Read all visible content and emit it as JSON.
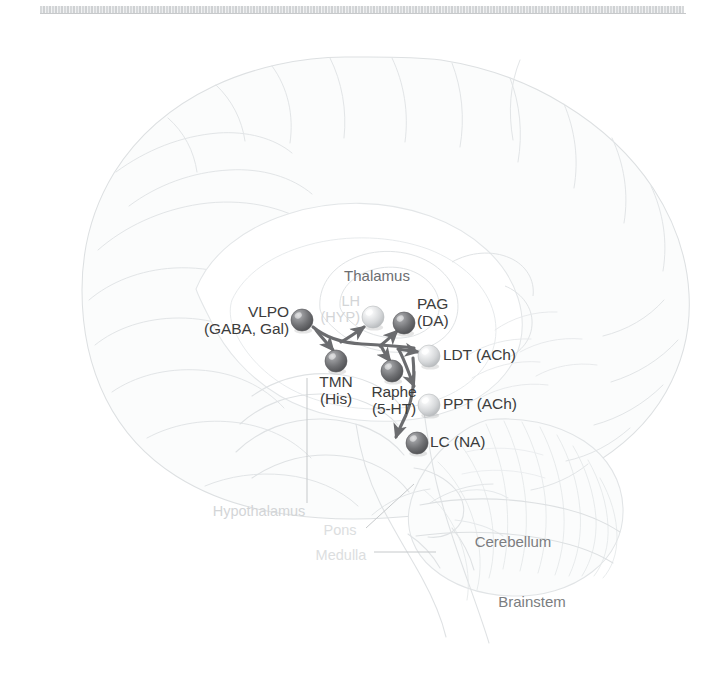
{
  "figure": {
    "background_color": "#ffffff",
    "scan_artifact": true
  },
  "anatomy_labels": [
    {
      "id": "thalamus",
      "text": "Thalamus",
      "x": 377,
      "y": 277,
      "style": "region-strong",
      "align": "center"
    },
    {
      "id": "hypothalamus",
      "text": "Hypothalamus",
      "x": 259,
      "y": 513,
      "style": "faint",
      "align": "center"
    },
    {
      "id": "pons",
      "text": "Pons",
      "x": 340,
      "y": 532,
      "style": "faint2",
      "align": "center"
    },
    {
      "id": "medulla",
      "text": "Medulla",
      "x": 341,
      "y": 557,
      "style": "faint2",
      "align": "center"
    },
    {
      "id": "cerebellum",
      "text": "Cerebellum",
      "x": 513,
      "y": 543,
      "style": "region",
      "align": "center"
    },
    {
      "id": "brainstem",
      "text": "Brainstem",
      "x": 532,
      "y": 603,
      "style": "region",
      "align": "center"
    }
  ],
  "nuclei": [
    {
      "id": "vlpo",
      "name": "VLPO",
      "transmitters": "(GABA, Gal)",
      "label_lines": [
        "VLPO",
        "(GABA, Gal)"
      ],
      "sphere": {
        "x": 302,
        "y": 320,
        "r": 11,
        "shade": "dark"
      },
      "label_pos": {
        "x": 289,
        "y": 305,
        "align": "right"
      }
    },
    {
      "id": "lh",
      "name": "LH",
      "transmitters": "(HYP)",
      "label_lines": [
        "LH",
        "(HYP)"
      ],
      "sphere": {
        "x": 373,
        "y": 317,
        "r": 11,
        "shade": "light"
      },
      "label_pos": {
        "x": 360,
        "y": 295,
        "align": "right"
      },
      "faded": true
    },
    {
      "id": "pag",
      "name": "PAG",
      "transmitters": "(DA)",
      "label_lines": [
        "PAG",
        "(DA)"
      ],
      "sphere": {
        "x": 404,
        "y": 323,
        "r": 11,
        "shade": "dark"
      },
      "label_pos": {
        "x": 418,
        "y": 297,
        "align": "left"
      }
    },
    {
      "id": "tmn",
      "name": "TMN",
      "transmitters": "(His)",
      "label_lines": [
        "TMN",
        "(His)"
      ],
      "sphere": {
        "x": 336,
        "y": 361,
        "r": 11,
        "shade": "dark"
      },
      "label_pos": {
        "x": 336,
        "y": 375,
        "align": "center"
      }
    },
    {
      "id": "raphe",
      "name": "Raphe",
      "transmitters": "(5-HT)",
      "label_lines": [
        "Raphe",
        "(5-HT)"
      ],
      "sphere": {
        "x": 392,
        "y": 371,
        "r": 11,
        "shade": "dark"
      },
      "label_pos": {
        "x": 392,
        "y": 385,
        "align": "center"
      }
    },
    {
      "id": "ldt",
      "name": "LDT",
      "transmitters": "(ACh)",
      "label_lines": [
        "LDT (ACh)"
      ],
      "sphere": {
        "x": 429,
        "y": 356,
        "r": 11,
        "shade": "light"
      },
      "label_pos": {
        "x": 444,
        "y": 348,
        "align": "left"
      }
    },
    {
      "id": "ppt",
      "name": "PPT",
      "transmitters": "(ACh)",
      "label_lines": [
        "PPT (ACh)"
      ],
      "sphere": {
        "x": 429,
        "y": 405,
        "r": 11,
        "shade": "light"
      },
      "label_pos": {
        "x": 444,
        "y": 397,
        "align": "left"
      }
    },
    {
      "id": "lc",
      "name": "LC",
      "transmitters": "(NA)",
      "label_lines": [
        "LC (NA)"
      ],
      "sphere": {
        "x": 417,
        "y": 443,
        "r": 11,
        "shade": "dark"
      },
      "label_pos": {
        "x": 431,
        "y": 435,
        "align": "left"
      }
    }
  ],
  "projections": [
    {
      "id": "vlpo-to-tmn",
      "from": "vlpo",
      "to": "tmn",
      "arrowhead": true
    },
    {
      "id": "vlpo-to-lh",
      "from": "vlpo",
      "to": "lh",
      "arrowhead": true
    },
    {
      "id": "vlpo-to-pag",
      "from": "vlpo",
      "to": "pag",
      "arrowhead": true
    },
    {
      "id": "vlpo-to-raphe",
      "from": "vlpo",
      "to": "raphe",
      "arrowhead": true
    },
    {
      "id": "vlpo-to-ldt",
      "from": "vlpo",
      "to": "ldt",
      "arrowhead": true
    },
    {
      "id": "ldt-to-ppt",
      "from": "ldt",
      "to": "ppt",
      "arrowhead": true
    },
    {
      "id": "ppt-to-lc",
      "from": "ppt",
      "to": "lc",
      "arrowhead": true
    }
  ],
  "leader_lines": [
    {
      "id": "hypothalamus-leader",
      "from": [
        307,
        503
      ],
      "to": [
        307,
        378
      ]
    },
    {
      "id": "pons-leader",
      "from": [
        366,
        528
      ],
      "to": [
        412,
        486
      ]
    },
    {
      "id": "medulla-leader",
      "from": [
        374,
        552
      ],
      "to": [
        434,
        552
      ]
    }
  ],
  "colors": {
    "sphere_dark": "#6f7073",
    "sphere_light": "#d6d8da",
    "arrow": "#6b6c6f",
    "brain_outline": "#dfe2e4",
    "brain_fill": "#fafbfb",
    "text_node": "#3c3c3c",
    "text_region": "#7b7d80",
    "text_faint": "#d3d5d7"
  }
}
